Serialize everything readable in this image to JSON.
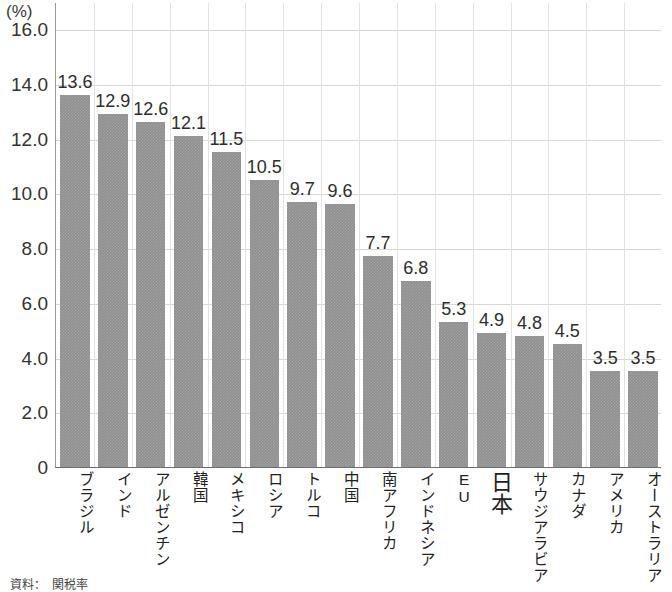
{
  "chart_data": {
    "type": "bar",
    "title": "",
    "subtitle": "",
    "xlabel": "",
    "ylabel": "",
    "unit_label": "(%)",
    "ylim": [
      0,
      17
    ],
    "ytick_values": [
      0,
      2.0,
      4.0,
      6.0,
      8.0,
      10.0,
      12.0,
      14.0,
      16.0
    ],
    "ytick_labels": [
      "0",
      "2.0",
      "4.0",
      "6.0",
      "8.0",
      "10.0",
      "12.0",
      "14.0",
      "16.0"
    ],
    "grid": true,
    "legend": "none",
    "bar_color": "#8f8f8f",
    "categories": [
      "ブラジル",
      "インド",
      "アルゼンチン",
      "韓国",
      "メキシコ",
      "ロシア",
      "トルコ",
      "中国",
      "南アフリカ",
      "インドネシア",
      "EU",
      "日本",
      "サウジアラビア",
      "カナダ",
      "アメリカ",
      "オーストラリア"
    ],
    "values": [
      13.6,
      12.9,
      12.6,
      12.1,
      11.5,
      10.5,
      9.7,
      9.6,
      7.7,
      6.8,
      5.3,
      4.9,
      4.8,
      4.5,
      3.5,
      3.5
    ],
    "value_labels": [
      "13.6",
      "12.9",
      "12.6",
      "12.1",
      "11.5",
      "10.5",
      "9.7",
      "9.6",
      "7.7",
      "6.8",
      "5.3",
      "4.9",
      "4.8",
      "4.5",
      "3.5",
      "3.5"
    ],
    "emphasized_category": "日本"
  },
  "footnote": {
    "text": "資料：　関税率"
  }
}
